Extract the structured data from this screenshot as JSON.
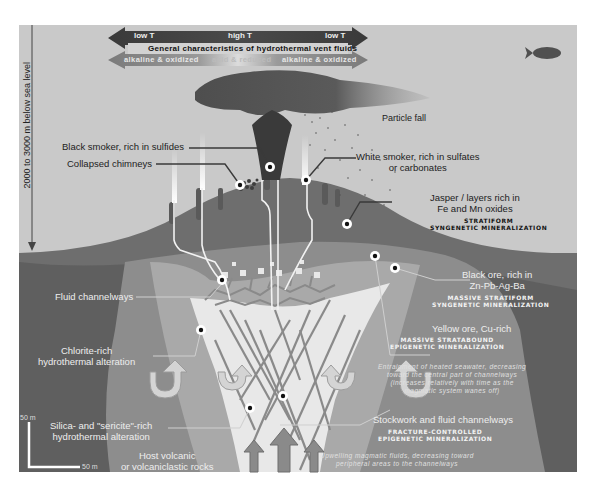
{
  "header": {
    "temp_left": "low T",
    "temp_center": "high T",
    "temp_right": "low T",
    "title": "General characteristics of hydrothermal vent fluids",
    "chem_left": "alkaline & oxidized",
    "chem_center": "acid & reduced",
    "chem_right": "alkaline & oxidized"
  },
  "depth_axis": {
    "label": "2000 to 3000 m below sea level"
  },
  "labels": {
    "particle_fall": "Particle fall",
    "black_smoker": "Black smoker, rich in sulfides",
    "collapsed_chimneys": "Collapsed chimneys",
    "white_smoker_line1": "White smoker, rich in sulfates",
    "white_smoker_line2": "or carbonates",
    "jasper_line1": "Jasper / layers rich in",
    "jasper_line2": "Fe and Mn oxides",
    "jasper_type_line1": "STRATIFORM",
    "jasper_type_line2": "SYNGENETIC MINERALIZATION",
    "black_ore_line1": "Black ore, rich in",
    "black_ore_line2": "Zn-Pb-Ag-Ba",
    "black_ore_type_line1": "MASSIVE STRATIFORM",
    "black_ore_type_line2": "SYNGENETIC MINERALIZATION",
    "fluid_channelways": "Fluid channelways",
    "yellow_ore": "Yellow ore, Cu-rich",
    "yellow_ore_type_line1": "MASSIVE STRATABOUND",
    "yellow_ore_type_line2": "EPIGENETIC MINERALIZATION",
    "chlorite_line1": "Chlorite-rich",
    "chlorite_line2": "hydrothermal alteration",
    "entrainment_line1": "Entrainment of heated seawater, decreasing",
    "entrainment_line2": "toward the central part of channelways",
    "entrainment_line3": "(increases relatively with time as the",
    "entrainment_line4": "magmatic system wanes off)",
    "silica_line1": "Silica- and \"sericite\"-rich",
    "silica_line2": "hydrothermal alteration",
    "stockwork": "Stockwork and fluid channelways",
    "stockwork_type_line1": "FRACTURE-CONTROLLED",
    "stockwork_type_line2": "EPIGENETIC MINERALIZATION",
    "host_line1": "Host volcanic",
    "host_line2": "or volcaniclastic rocks",
    "upwelling_line1": "Upwelling magmatic fluids, decreasing toward",
    "upwelling_line2": "peripheral areas to the channelways"
  },
  "scale": {
    "vertical": "50 m",
    "horizontal": "50 m"
  },
  "icons": {
    "fish": "fish-icon",
    "plume": "smoke-plume-icon"
  },
  "colors": {
    "seawater": "#c9c9c9",
    "mound": "#6e6e6e",
    "host_rock": "#5f5f5f",
    "chlorite_zone": "#8d8d8d",
    "silica_zone": "#a9a9a9",
    "core": "#e8e8e8",
    "plume": "#555555"
  }
}
